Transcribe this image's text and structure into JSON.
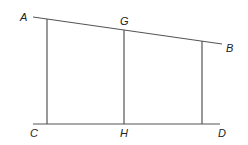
{
  "diagram": {
    "colors": {
      "line": "#555555",
      "label": "#222222",
      "background": "#ffffff"
    },
    "labels": {
      "A": "A",
      "B": "B",
      "C": "C",
      "D": "D",
      "G": "G",
      "H": "H"
    },
    "lines": [
      {
        "name": "line-AB",
        "from": "A",
        "to": "B"
      },
      {
        "name": "line-CD",
        "from": "C",
        "to": "D"
      },
      {
        "name": "left-vertical",
        "from": "top-line",
        "to": "bottom-line"
      },
      {
        "name": "segment-GH",
        "from": "G",
        "to": "H"
      },
      {
        "name": "right-vertical",
        "from": "top-line",
        "to": "bottom-line"
      }
    ]
  }
}
